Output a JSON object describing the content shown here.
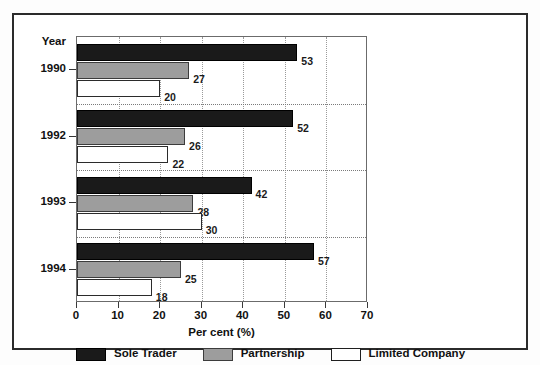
{
  "chart_data": {
    "type": "bar",
    "orientation": "horizontal",
    "title": "",
    "xlabel": "Per cent (%)",
    "ylabel": "Year",
    "categories": [
      "1990",
      "1992",
      "1993",
      "1994"
    ],
    "series": [
      {
        "name": "Sole Trader",
        "color": "#1a1a1a",
        "values": [
          53,
          52,
          42,
          57
        ]
      },
      {
        "name": "Partnership",
        "color": "#9d9d9d",
        "values": [
          27,
          26,
          28,
          25
        ]
      },
      {
        "name": "Limited Company",
        "color": "#ffffff",
        "values": [
          20,
          22,
          30,
          18
        ]
      }
    ],
    "xlim": [
      0,
      70
    ],
    "xticks": [
      0,
      10,
      20,
      30,
      40,
      50,
      60,
      70
    ],
    "xtick_labels": [
      "0",
      "10",
      "20",
      "30",
      "40",
      "50",
      "60",
      "70"
    ],
    "grid": "vertical-dotted",
    "legend_position": "bottom-left",
    "data_labels": true
  },
  "axes": {
    "year_header": "Year",
    "x_title": "Per cent (%)"
  },
  "legend": {
    "items": [
      {
        "label": "Sole Trader",
        "swatch": "sole"
      },
      {
        "label": "Partnership",
        "swatch": "partnership"
      },
      {
        "label": "Limited Company",
        "swatch": "limited"
      }
    ]
  }
}
